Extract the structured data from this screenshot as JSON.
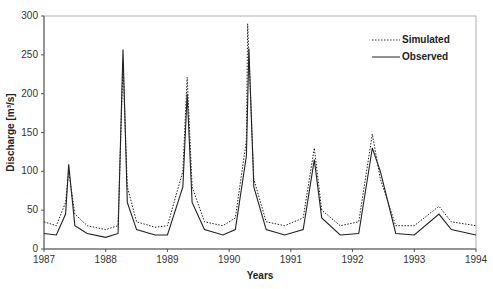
{
  "chart_data": {
    "type": "line",
    "title": "",
    "xlabel": "Years",
    "ylabel": "Discharge [m³/s]",
    "xlim": [
      1987,
      1994
    ],
    "ylim": [
      0,
      300
    ],
    "x_ticks": [
      "1987",
      "1988",
      "1989",
      "1990",
      "1991",
      "1992",
      "1993",
      "1994"
    ],
    "y_ticks": [
      "0",
      "50",
      "100",
      "150",
      "200",
      "250",
      "300"
    ],
    "legend": {
      "position": "top-right",
      "entries": [
        "Simulated",
        "Observed"
      ]
    },
    "grid": false,
    "series": [
      {
        "name": "Simulated",
        "style": "dotted",
        "x": [
          1987.0,
          1987.2,
          1987.35,
          1987.4,
          1987.5,
          1987.7,
          1988.0,
          1988.2,
          1988.28,
          1988.35,
          1988.5,
          1988.8,
          1989.0,
          1989.25,
          1989.32,
          1989.4,
          1989.6,
          1989.9,
          1990.1,
          1990.28,
          1990.3,
          1990.4,
          1990.6,
          1990.9,
          1991.2,
          1991.38,
          1991.5,
          1991.8,
          1992.1,
          1992.32,
          1992.45,
          1992.7,
          1993.0,
          1993.4,
          1993.6,
          1994.0
        ],
        "y": [
          35,
          30,
          60,
          100,
          45,
          30,
          25,
          30,
          240,
          80,
          35,
          28,
          30,
          100,
          221,
          80,
          35,
          30,
          40,
          140,
          290,
          90,
          35,
          30,
          40,
          130,
          50,
          30,
          35,
          148,
          90,
          30,
          30,
          55,
          35,
          30
        ]
      },
      {
        "name": "Observed",
        "style": "solid",
        "x": [
          1987.0,
          1987.2,
          1987.35,
          1987.4,
          1987.5,
          1987.7,
          1988.0,
          1988.2,
          1988.28,
          1988.35,
          1988.5,
          1988.8,
          1989.0,
          1989.25,
          1989.32,
          1989.4,
          1989.6,
          1989.9,
          1990.1,
          1990.28,
          1990.32,
          1990.4,
          1990.6,
          1990.9,
          1991.2,
          1991.38,
          1991.5,
          1991.8,
          1992.1,
          1992.32,
          1992.45,
          1992.7,
          1993.0,
          1993.4,
          1993.6,
          1994.0
        ],
        "y": [
          20,
          18,
          45,
          109,
          30,
          20,
          15,
          20,
          257,
          60,
          25,
          18,
          18,
          80,
          200,
          60,
          25,
          18,
          25,
          120,
          258,
          80,
          25,
          18,
          25,
          115,
          40,
          18,
          20,
          130,
          100,
          20,
          18,
          45,
          25,
          18
        ]
      }
    ]
  },
  "axis": {
    "ylabel": "Discharge [m³/s]",
    "xlabel": "Years"
  },
  "legend": {
    "simulated": "Simulated",
    "observed": "Observed"
  }
}
